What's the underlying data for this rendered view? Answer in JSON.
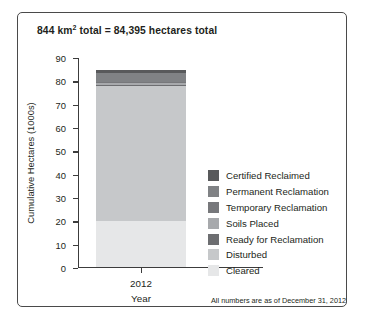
{
  "title": {
    "prefix": "844 km",
    "superscript": "2",
    "suffix": " total = 84,395 hectares total"
  },
  "footnote": "All numbers are as of December 31, 2012",
  "axes": {
    "ylabel": "Cumulative Hectares (1000s)",
    "xlabel": "Year",
    "yticks": [
      "90",
      "80",
      "70",
      "60",
      "50",
      "40",
      "30",
      "20",
      "10",
      "0"
    ],
    "xticks": [
      "2012"
    ]
  },
  "legend": {
    "position": "right",
    "items": [
      {
        "label": "Certified Reclaimed",
        "color": "#58595b"
      },
      {
        "label": "Permanent Reclamation",
        "color": "#808285"
      },
      {
        "label": "Temporary Reclamation",
        "color": "#77787b"
      },
      {
        "label": "Soils Placed",
        "color": "#a7a9ac"
      },
      {
        "label": "Ready for Reclamation",
        "color": "#6d6e71"
      },
      {
        "label": "Disturbed",
        "color": "#c6c8ca"
      },
      {
        "label": "Cleared",
        "color": "#e6e7e8"
      }
    ]
  },
  "chart_data": {
    "type": "bar",
    "subtype": "stacked",
    "title": "844 km2 total = 84,395 hectares total",
    "xlabel": "Year",
    "ylabel": "Cumulative Hectares (1000s)",
    "categories": [
      "2012"
    ],
    "ylim": [
      0,
      90
    ],
    "ytick_step": 10,
    "grid": false,
    "units": "thousands of hectares",
    "total": 84.395,
    "stack_order_bottom_to_top": [
      "Cleared",
      "Disturbed",
      "Ready for Reclamation",
      "Soils Placed",
      "Temporary Reclamation",
      "Permanent Reclamation",
      "Certified Reclaimed"
    ],
    "series": [
      {
        "name": "Cleared",
        "values": [
          19.6
        ],
        "color": "#e6e7e8"
      },
      {
        "name": "Disturbed",
        "values": [
          57.8
        ],
        "color": "#c6c8ca"
      },
      {
        "name": "Ready for Reclamation",
        "values": [
          0.7
        ],
        "color": "#6d6e71"
      },
      {
        "name": "Soils Placed",
        "values": [
          0.6
        ],
        "color": "#a7a9ac"
      },
      {
        "name": "Temporary Reclamation",
        "values": [
          0.6
        ],
        "color": "#77787b"
      },
      {
        "name": "Permanent Reclamation",
        "values": [
          4.0
        ],
        "color": "#808285"
      },
      {
        "name": "Certified Reclaimed",
        "values": [
          1.1
        ],
        "color": "#58595b"
      }
    ]
  }
}
